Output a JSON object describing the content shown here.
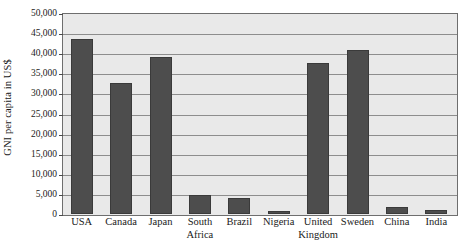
{
  "chart_data": {
    "type": "bar",
    "title": "",
    "xlabel": "",
    "ylabel": "GNI per capita in US$",
    "categories": [
      "USA",
      "Canada",
      "Japan",
      "South Africa",
      "Brazil",
      "Nigeria",
      "United Kingdom",
      "Sweden",
      "China",
      "India"
    ],
    "category_lines": [
      [
        "USA",
        ""
      ],
      [
        "Canada",
        ""
      ],
      [
        "Japan",
        ""
      ],
      [
        "South",
        "Africa"
      ],
      [
        "Brazil",
        ""
      ],
      [
        "Nigeria",
        ""
      ],
      [
        "United",
        "Kingdom"
      ],
      [
        "Sweden",
        ""
      ],
      [
        "China",
        ""
      ],
      [
        "India",
        ""
      ]
    ],
    "values": [
      43600,
      32600,
      39050,
      4700,
      4000,
      750,
      37600,
      40800,
      1700,
      1000
    ],
    "ylim": [
      0,
      50000
    ],
    "ytick_values": [
      0,
      5000,
      10000,
      15000,
      20000,
      25000,
      30000,
      35000,
      40000,
      45000,
      50000
    ],
    "ytick_labels": [
      "0",
      "5,000",
      "10,000",
      "15,000",
      "20,000",
      "25,000",
      "30,000",
      "35,000",
      "40,000",
      "45,000",
      "50,000"
    ],
    "grid": true,
    "legend": "none",
    "bar_color": "#4d4d4d",
    "plot_background": "#e9e9e9",
    "axis_color": "#6e6e6e",
    "gridline_color": "#8d8d8d"
  }
}
